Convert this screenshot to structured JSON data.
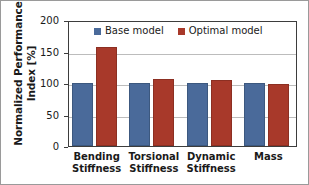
{
  "chart_data": {
    "type": "bar",
    "title": "",
    "xlabel": "",
    "ylabel": "Normalized Performance Index [%]",
    "ylabel_lines": [
      "Normalized Performance",
      "Index [%]"
    ],
    "ylim": [
      0,
      200
    ],
    "yticks": [
      200,
      150,
      100,
      50,
      0
    ],
    "grid": true,
    "legend_position": "top-center-inside",
    "categories": [
      "Bending Stiffness",
      "Torsional Stiffness",
      "Dynamic Stiffness",
      "Mass"
    ],
    "category_lines": [
      [
        "Bending",
        "Stiffness"
      ],
      [
        "Torsional",
        "Stiffness"
      ],
      [
        "Dynamic",
        "Stiffness"
      ],
      [
        "Mass",
        ""
      ]
    ],
    "series": [
      {
        "name": "Base model",
        "color": "#4a6a9a",
        "values": [
          100,
          100,
          100,
          100
        ]
      },
      {
        "name": "Optimal model",
        "color": "#a8392a",
        "values": [
          157,
          107,
          104,
          98
        ]
      }
    ]
  },
  "legend": {
    "items": [
      {
        "label": "Base model",
        "color": "#4a6a9a"
      },
      {
        "label": "Optimal model",
        "color": "#a8392a"
      }
    ]
  },
  "axis": {
    "y_tick_labels": [
      "200",
      "150",
      "100",
      "50",
      "0"
    ]
  }
}
